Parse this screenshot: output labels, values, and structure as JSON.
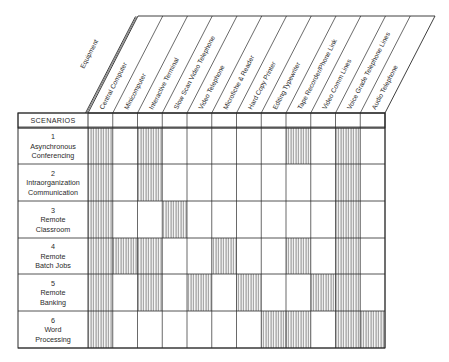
{
  "diagram": {
    "equipment_label": "Equipment",
    "scenarios_header": "SCENARIOS",
    "columns": [
      "Central Computer",
      "Minicomputer",
      "Interactive Terminal",
      "Slow Scan Video Telephone",
      "Video Telephone",
      "Microfiche & Reader",
      "Hard Copy Printer",
      "Editing Typewriter",
      "Tape Recorder/Phone Link",
      "Video Comm Lines",
      "Voice Grade Telephone Lines",
      "Audio Telephone"
    ],
    "scenarios": [
      {
        "number": "1",
        "lines": [
          "Asynchronous",
          "Conferencing"
        ],
        "required": [
          1,
          3,
          9,
          11
        ]
      },
      {
        "number": "2",
        "lines": [
          "Intraorganization",
          "Communication"
        ],
        "required": [
          1,
          3,
          11
        ]
      },
      {
        "number": "3",
        "lines": [
          "Remote",
          "Classroom"
        ],
        "required": [
          1,
          4,
          11
        ]
      },
      {
        "number": "4",
        "lines": [
          "Remote",
          "Batch  Jobs"
        ],
        "required": [
          1,
          2,
          3,
          6,
          9,
          11
        ]
      },
      {
        "number": "5",
        "lines": [
          "Remote",
          "Banking"
        ],
        "required": [
          1,
          3,
          5,
          7,
          10,
          11
        ]
      },
      {
        "number": "6",
        "lines": [
          "Word",
          "Processing"
        ],
        "required": [
          1,
          8,
          9,
          11,
          12
        ]
      }
    ],
    "colors": {
      "line": "#2a2a2a",
      "hatch": "#3a3a3a",
      "background": "#ffffff"
    }
  }
}
